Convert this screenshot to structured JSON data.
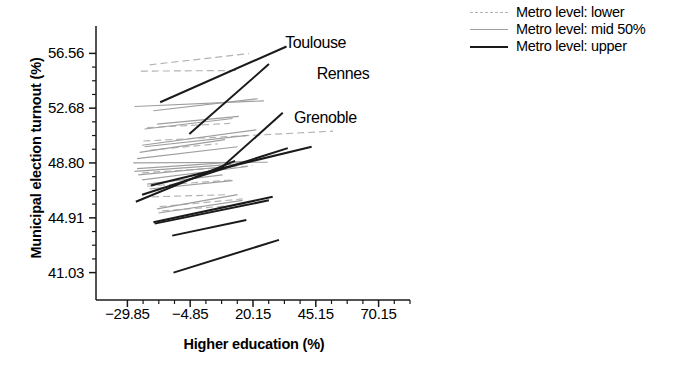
{
  "chart_data": {
    "type": "line",
    "title": "",
    "subtitle": "",
    "xlabel": "Higher education (%)",
    "ylabel": "Municipal election turnout (%)",
    "xlim": [
      -42.35,
      82.65
    ],
    "ylim": [
      39.09,
      58.5
    ],
    "xticks": [
      -29.85,
      -4.85,
      20.15,
      45.15,
      70.15
    ],
    "xtick_labels": [
      "−29.85",
      "−4.85",
      "20.15",
      "45.15",
      "70.15"
    ],
    "yticks": [
      41.03,
      44.91,
      48.8,
      52.68,
      56.56
    ],
    "ytick_labels": [
      "41.03",
      "44.91",
      "48.80",
      "52.68",
      "56.56"
    ],
    "grid": false,
    "legend_position": "upper right",
    "legend": [
      {
        "label": "Metro level: lower",
        "style": "dashed",
        "color": "#b3b3b3"
      },
      {
        "label": "Metro level: mid 50%",
        "style": "solid",
        "color": "#9e9e9e"
      },
      {
        "label": "Metro level: upper",
        "style": "solid",
        "color": "#1a1a1a"
      }
    ],
    "annotations": [
      {
        "text": "Toulouse",
        "x": 33.0,
        "y": 57.3
      },
      {
        "text": "Rennes",
        "x": 45.5,
        "y": 55.1
      },
      {
        "text": "Grenoble",
        "x": 36.5,
        "y": 52.0
      }
    ],
    "series": [
      {
        "name": "upper-1",
        "group": "upper",
        "style": "solid",
        "color": "#1a1a1a",
        "x": [
          -16.8,
          33.5
        ],
        "y": [
          53.1,
          57.05
        ]
      },
      {
        "name": "upper-2",
        "group": "upper",
        "style": "solid",
        "color": "#1a1a1a",
        "x": [
          -5.2,
          26.5
        ],
        "y": [
          50.85,
          55.8
        ]
      },
      {
        "name": "upper-3",
        "group": "upper",
        "style": "solid",
        "color": "#1a1a1a",
        "x": [
          7.5,
          32.0
        ],
        "y": [
          48.45,
          52.35
        ]
      },
      {
        "name": "upper-4",
        "group": "upper",
        "style": "solid",
        "color": "#1a1a1a",
        "x": [
          -26.5,
          13.0
        ],
        "y": [
          46.05,
          48.95
        ]
      },
      {
        "name": "upper-5",
        "group": "upper",
        "style": "solid",
        "color": "#1a1a1a",
        "x": [
          -20.5,
          43.5
        ],
        "y": [
          47.2,
          49.95
        ]
      },
      {
        "name": "upper-6",
        "group": "upper",
        "style": "solid",
        "color": "#1a1a1a",
        "x": [
          -24.0,
          34.0
        ],
        "y": [
          46.55,
          49.85
        ]
      },
      {
        "name": "upper-7",
        "group": "upper",
        "style": "solid",
        "color": "#1a1a1a",
        "x": [
          -19.5,
          28.0
        ],
        "y": [
          44.6,
          46.4
        ]
      },
      {
        "name": "upper-8",
        "group": "upper",
        "style": "solid",
        "color": "#1a1a1a",
        "x": [
          -19.0,
          26.5
        ],
        "y": [
          44.5,
          46.15
        ]
      },
      {
        "name": "upper-9",
        "group": "upper",
        "style": "solid",
        "color": "#1a1a1a",
        "x": [
          -12.0,
          17.5
        ],
        "y": [
          43.65,
          44.75
        ]
      },
      {
        "name": "upper-10",
        "group": "upper",
        "style": "solid",
        "color": "#1a1a1a",
        "x": [
          -11.5,
          30.5
        ],
        "y": [
          41.03,
          43.35
        ]
      },
      {
        "name": "mid-1",
        "group": "mid",
        "style": "solid",
        "color": "#9e9e9e",
        "x": [
          -27.0,
          24.5
        ],
        "y": [
          52.8,
          53.2
        ]
      },
      {
        "name": "mid-2",
        "group": "mid",
        "style": "solid",
        "color": "#9e9e9e",
        "x": [
          -19.5,
          22.0
        ],
        "y": [
          52.5,
          53.35
        ]
      },
      {
        "name": "mid-3",
        "group": "mid",
        "style": "solid",
        "color": "#9e9e9e",
        "x": [
          -18.0,
          14.5
        ],
        "y": [
          51.55,
          52.1
        ]
      },
      {
        "name": "mid-4",
        "group": "mid",
        "style": "solid",
        "color": "#9e9e9e",
        "x": [
          -23.0,
          12.0
        ],
        "y": [
          51.2,
          51.95
        ]
      },
      {
        "name": "mid-5",
        "group": "mid",
        "style": "solid",
        "color": "#9e9e9e",
        "x": [
          -24.0,
          21.5
        ],
        "y": [
          50.05,
          51.15
        ]
      },
      {
        "name": "mid-6",
        "group": "mid",
        "style": "solid",
        "color": "#9e9e9e",
        "x": [
          -23.0,
          18.0
        ],
        "y": [
          49.95,
          50.75
        ]
      },
      {
        "name": "mid-7",
        "group": "mid",
        "style": "solid",
        "color": "#9e9e9e",
        "x": [
          -25.0,
          9.0
        ],
        "y": [
          49.55,
          50.45
        ]
      },
      {
        "name": "mid-8",
        "group": "mid",
        "style": "solid",
        "color": "#9e9e9e",
        "x": [
          -26.0,
          14.0
        ],
        "y": [
          49.1,
          49.95
        ]
      },
      {
        "name": "mid-9",
        "group": "mid",
        "style": "solid",
        "color": "#9e9e9e",
        "x": [
          -27.5,
          26.0
        ],
        "y": [
          48.8,
          48.85
        ]
      },
      {
        "name": "mid-10",
        "group": "mid",
        "style": "solid",
        "color": "#9e9e9e",
        "x": [
          -26.0,
          20.0
        ],
        "y": [
          48.4,
          48.95
        ]
      },
      {
        "name": "mid-11",
        "group": "mid",
        "style": "solid",
        "color": "#9e9e9e",
        "x": [
          -27.0,
          16.0
        ],
        "y": [
          48.2,
          48.75
        ]
      },
      {
        "name": "mid-12",
        "group": "mid",
        "style": "solid",
        "color": "#9e9e9e",
        "x": [
          -25.5,
          10.0
        ],
        "y": [
          47.95,
          48.55
        ]
      },
      {
        "name": "mid-13",
        "group": "mid",
        "style": "solid",
        "color": "#9e9e9e",
        "x": [
          -24.0,
          18.0
        ],
        "y": [
          47.6,
          48.55
        ]
      },
      {
        "name": "mid-14",
        "group": "mid",
        "style": "solid",
        "color": "#9e9e9e",
        "x": [
          -22.0,
          8.0
        ],
        "y": [
          47.3,
          47.95
        ]
      },
      {
        "name": "mid-15",
        "group": "mid",
        "style": "solid",
        "color": "#9e9e9e",
        "x": [
          -21.0,
          12.0
        ],
        "y": [
          46.95,
          47.55
        ]
      },
      {
        "name": "mid-16",
        "group": "mid",
        "style": "solid",
        "color": "#9e9e9e",
        "x": [
          -18.0,
          14.0
        ],
        "y": [
          45.55,
          46.55
        ]
      },
      {
        "name": "mid-17",
        "group": "mid",
        "style": "solid",
        "color": "#9e9e9e",
        "x": [
          -17.5,
          16.0
        ],
        "y": [
          45.25,
          46.15
        ]
      },
      {
        "name": "lower-1",
        "group": "lower",
        "style": "dashed",
        "color": "#b3b3b3",
        "x": [
          -21.0,
          18.5
        ],
        "y": [
          55.75,
          56.55
        ]
      },
      {
        "name": "lower-2",
        "group": "lower",
        "style": "dashed",
        "color": "#b3b3b3",
        "x": [
          -24.5,
          13.5
        ],
        "y": [
          55.3,
          55.35
        ]
      },
      {
        "name": "lower-3",
        "group": "lower",
        "style": "dashed",
        "color": "#b3b3b3",
        "x": [
          -22.0,
          11.0
        ],
        "y": [
          51.3,
          51.6
        ]
      },
      {
        "name": "lower-4",
        "group": "lower",
        "style": "dashed",
        "color": "#b3b3b3",
        "x": [
          -23.5,
          52.0
        ],
        "y": [
          50.35,
          51.05
        ]
      },
      {
        "name": "lower-5",
        "group": "lower",
        "style": "dashed",
        "color": "#b3b3b3",
        "x": [
          -21.0,
          6.0
        ],
        "y": [
          49.7,
          50.15
        ]
      },
      {
        "name": "lower-6",
        "group": "lower",
        "style": "dashed",
        "color": "#b3b3b3",
        "x": [
          -24.0,
          20.0
        ],
        "y": [
          48.1,
          48.6
        ]
      },
      {
        "name": "lower-7",
        "group": "lower",
        "style": "dashed",
        "color": "#b3b3b3",
        "x": [
          -22.0,
          12.0
        ],
        "y": [
          47.15,
          47.6
        ]
      },
      {
        "name": "lower-8",
        "group": "lower",
        "style": "dashed",
        "color": "#b3b3b3",
        "x": [
          -20.0,
          10.0
        ],
        "y": [
          46.4,
          46.55
        ]
      },
      {
        "name": "lower-9",
        "group": "lower",
        "style": "dashed",
        "color": "#b3b3b3",
        "x": [
          -17.0,
          16.0
        ],
        "y": [
          45.7,
          46.25
        ]
      },
      {
        "name": "lower-10",
        "group": "lower",
        "style": "dashed",
        "color": "#b3b3b3",
        "x": [
          -16.0,
          17.0
        ],
        "y": [
          45.4,
          45.85
        ]
      }
    ]
  },
  "axes": {
    "y_title": "Municipal election turnout (%)",
    "x_title": "Higher education (%)"
  },
  "legend": {
    "items": [
      {
        "label": "Metro level: lower",
        "key": "lower"
      },
      {
        "label": "Metro level: mid 50%",
        "key": "mid"
      },
      {
        "label": "Metro level: upper",
        "key": "upper"
      }
    ]
  }
}
